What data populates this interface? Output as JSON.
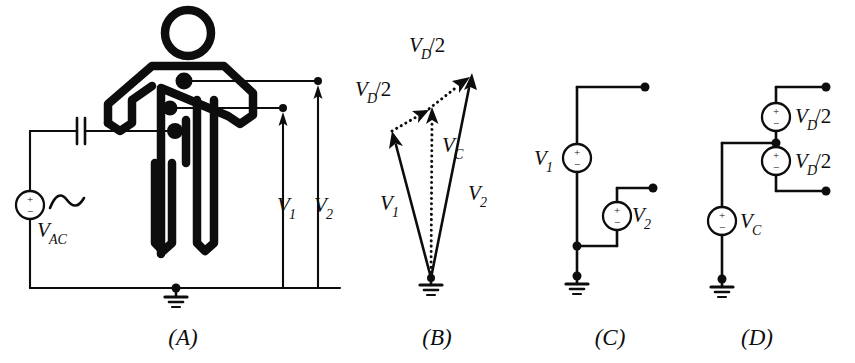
{
  "figure": {
    "ink_color": "#0d0d0d",
    "background_color": "#ffffff"
  },
  "panels": [
    {
      "id": "A",
      "label": "(A)",
      "label_x": 183,
      "label_y": 345,
      "title_text": "A",
      "components": {
        "ac_source_label": "V",
        "ac_source_subscript": "AC",
        "plus_sign": "+",
        "minus_sign": "−",
        "measurement_labels": [
          {
            "name": "V",
            "subscript": "1",
            "x": 285,
            "y": 205
          },
          {
            "name": "V",
            "subscript": "2",
            "x": 322,
            "y": 205
          }
        ],
        "electrode_count": 3,
        "has_capacitor": true,
        "has_ground": true,
        "has_body_figure": true
      }
    },
    {
      "id": "B",
      "label": "(B)",
      "label_x": 437,
      "label_y": 345,
      "title_text": "B",
      "vectors": [
        {
          "name": "V",
          "subscript": "1",
          "style": "solid",
          "label_x": 386,
          "label_y": 208
        },
        {
          "name": "V",
          "subscript": "2",
          "style": "solid",
          "label_x": 474,
          "label_y": 197
        },
        {
          "name": "V",
          "subscript": "C",
          "style": "dotted",
          "label_x": 448,
          "label_y": 148
        }
      ],
      "diff_labels": [
        {
          "name": "V",
          "subscript": "D",
          "frac": "/2",
          "x": 357,
          "y": 92
        },
        {
          "name": "V",
          "subscript": "D",
          "frac": "/2",
          "x": 411,
          "y": 48
        }
      ],
      "has_ground": true
    },
    {
      "id": "C",
      "label": "(C)",
      "label_x": 610,
      "label_y": 345,
      "title_text": "C",
      "sources": [
        {
          "name": "V",
          "subscript": "1",
          "label_x": 540,
          "label_y": 163,
          "plus": "+",
          "minus": "−"
        },
        {
          "name": "V",
          "subscript": "2",
          "label_x": 631,
          "label_y": 222,
          "plus": "+",
          "minus": "−"
        }
      ],
      "terminal_count": 2,
      "has_ground": true
    },
    {
      "id": "D",
      "label": "(D)",
      "label_x": 757,
      "label_y": 345,
      "title_text": "D",
      "sources": [
        {
          "name": "V",
          "subscript": "D",
          "frac": "/2",
          "label_x": 770,
          "label_y": 125,
          "plus": "+",
          "minus": "−"
        },
        {
          "name": "V",
          "subscript": "D",
          "frac": "/2",
          "label_x": 770,
          "label_y": 172,
          "plus": "+",
          "minus": "−"
        },
        {
          "name": "V",
          "subscript": "C",
          "frac": "",
          "label_x": 726,
          "label_y": 228,
          "plus": "+",
          "minus": "−"
        }
      ],
      "terminal_count": 2,
      "has_ground": true
    }
  ]
}
